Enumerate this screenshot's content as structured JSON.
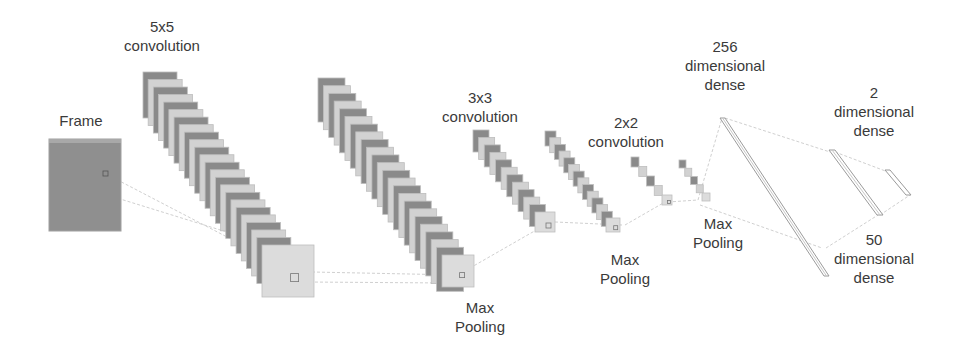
{
  "diagram": {
    "type": "cnn-architecture",
    "colors": {
      "background": "#ffffff",
      "map_dark": "#8a8a8a",
      "map_light": "#d2d2d2",
      "map_edge": "#bdbdbd",
      "frame_fill": "#8f8f8f",
      "dense_stroke": "#9a9a9a",
      "connector": "#cfcfcf",
      "text": "#3a3a3a"
    },
    "labels": {
      "frame": "Frame",
      "conv5": [
        "5x5",
        "convolution"
      ],
      "pool1": [
        "Max",
        "Pooling"
      ],
      "conv3": [
        "3x3",
        "convolution"
      ],
      "conv2": [
        "2x2",
        "convolution"
      ],
      "pool2": [
        "Max",
        "Pooling"
      ],
      "pool3": [
        "Max",
        "Pooling"
      ],
      "dense256": [
        "256",
        "dimensional",
        "dense"
      ],
      "dense2": [
        "2",
        "dimensional",
        "dense"
      ],
      "dense50": [
        "50",
        "dimensional",
        "dense"
      ]
    },
    "layers": [
      {
        "name": "input-frame",
        "label": "Frame"
      },
      {
        "name": "conv-5x5",
        "label": "5x5 convolution"
      },
      {
        "name": "max-pooling-1",
        "label": "Max Pooling"
      },
      {
        "name": "conv-3x3",
        "label": "3x3 convolution"
      },
      {
        "name": "max-pooling-2",
        "label": "Max Pooling"
      },
      {
        "name": "conv-2x2",
        "label": "2x2 convolution"
      },
      {
        "name": "max-pooling-3",
        "label": "Max Pooling"
      },
      {
        "name": "dense-256",
        "label": "256 dimensional dense"
      },
      {
        "name": "dense-50",
        "label": "50 dimensional dense"
      },
      {
        "name": "dense-2",
        "label": "2 dimensional dense"
      }
    ]
  }
}
